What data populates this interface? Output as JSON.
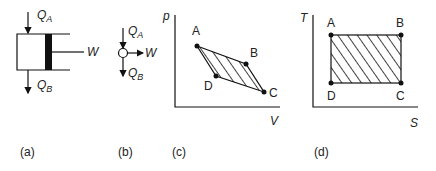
{
  "figure": {
    "panels": [
      {
        "id": "a",
        "caption": "(a)",
        "type": "piston-cylinder",
        "labels": {
          "heat_in": "Q",
          "heat_in_sub": "A",
          "heat_out": "Q",
          "heat_out_sub": "B",
          "work": "W"
        }
      },
      {
        "id": "b",
        "caption": "(b)",
        "type": "engine-symbol",
        "labels": {
          "heat_in": "Q",
          "heat_in_sub": "A",
          "heat_out": "Q",
          "heat_out_sub": "B",
          "work": "W"
        }
      },
      {
        "id": "c",
        "caption": "(c)",
        "type": "p-V diagram",
        "axes": {
          "y": "p",
          "x": "V"
        },
        "points": [
          "A",
          "B",
          "C",
          "D"
        ]
      },
      {
        "id": "d",
        "caption": "(d)",
        "type": "T-S diagram",
        "axes": {
          "y": "T",
          "x": "S"
        },
        "points": [
          "A",
          "B",
          "C",
          "D"
        ]
      }
    ]
  },
  "colors": {
    "ink": "#111111",
    "background": "#ffffff"
  }
}
